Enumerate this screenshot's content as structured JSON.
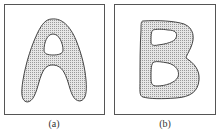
{
  "figure": {
    "panels": [
      {
        "id": "a",
        "letter": "A",
        "caption": "(a)"
      },
      {
        "id": "b",
        "letter": "B",
        "caption": "(b)"
      }
    ],
    "colors": {
      "fill": "#c8c8c8",
      "stroke": "#444444",
      "frame": "#555555"
    }
  }
}
